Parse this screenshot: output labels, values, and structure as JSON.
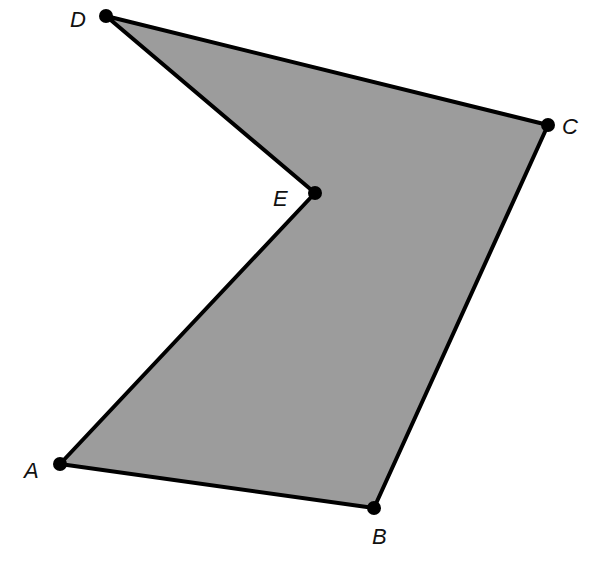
{
  "diagram": {
    "type": "polygon",
    "fill_color": "#9c9c9c",
    "stroke_color": "#000000",
    "vertices": [
      {
        "label": "A",
        "x": 60,
        "y": 464,
        "lx": 24,
        "ly": 478
      },
      {
        "label": "B",
        "x": 374,
        "y": 508,
        "lx": 372,
        "ly": 544
      },
      {
        "label": "C",
        "x": 548,
        "y": 125,
        "lx": 562,
        "ly": 134
      },
      {
        "label": "D",
        "x": 106,
        "y": 16,
        "lx": 70,
        "ly": 27
      },
      {
        "label": "E",
        "x": 315,
        "y": 193,
        "lx": 273,
        "ly": 206
      }
    ],
    "order": [
      "A",
      "B",
      "C",
      "D",
      "E"
    ]
  }
}
